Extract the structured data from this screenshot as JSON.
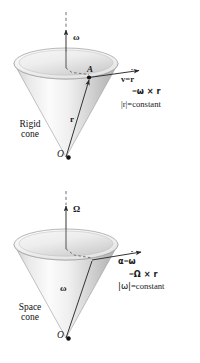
{
  "figure": {
    "background_color": "#ffffff",
    "ink_color": "#1a1a1a",
    "cone_fill_light": "#fdfdfd",
    "cone_fill_mid": "#d8d8d8",
    "cone_fill_dark": "#a8a8a8"
  },
  "panels": [
    {
      "id": "rigid-cone",
      "cone_label_line1": "Rigid",
      "cone_label_line2": "cone",
      "axis_symbol": "ω",
      "origin_symbol": "O",
      "point_symbol": "A",
      "radius_vector_symbol": "r",
      "equations": {
        "line1_lhs": "v",
        "line1_eq": "=",
        "line1_rhs": "ṙ",
        "line2_eq": "=",
        "line2_rhs": "ω × r",
        "line3_lhs": "|r|",
        "line3_eq": "=",
        "line3_rhs": "constant"
      }
    },
    {
      "id": "space-cone",
      "cone_label_line1": "Space",
      "cone_label_line2": "cone",
      "axis_symbol": "Ω",
      "origin_symbol": "O",
      "slant_vector_symbol": "ω",
      "equations": {
        "line1_lhs": "α",
        "line1_eq": "=",
        "line1_rhs": "ω̇",
        "line2_eq": "=",
        "line2_rhs": "Ω × r",
        "line3_lhs": "|ω|",
        "line3_eq": "=",
        "line3_rhs": "constant"
      }
    }
  ]
}
